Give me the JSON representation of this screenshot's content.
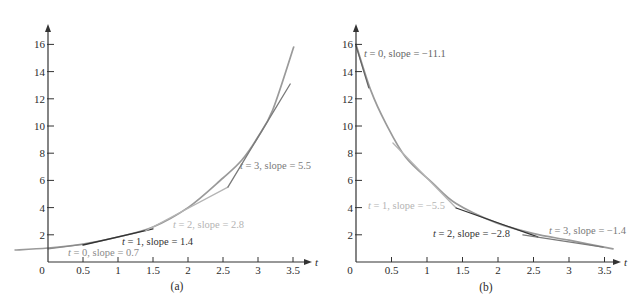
{
  "chart_data": [
    {
      "type": "line",
      "title": "(a)",
      "caption": "(a)",
      "xlabel": "t",
      "ylabel": "",
      "xlim": [
        0,
        3.5
      ],
      "ylim": [
        0,
        16
      ],
      "grid": false,
      "legend": null,
      "origin_label": "0",
      "x_ticks": [
        0.5,
        1,
        1.5,
        2,
        2.5,
        3,
        3.5
      ],
      "x_tick_labels": [
        "0.5",
        "1",
        "1.5",
        "2",
        "2.5",
        "3",
        "3.5"
      ],
      "y_ticks": [
        2,
        4,
        6,
        8,
        10,
        12,
        14,
        16
      ],
      "y_tick_labels": [
        "2",
        "4",
        "6",
        "8",
        "10",
        "12",
        "14",
        "16"
      ],
      "series": [
        {
          "name": "increasing curve",
          "color": "#9a9a9a",
          "points": [
            [
              -0.47,
              0.88
            ],
            [
              0,
              1.03
            ],
            [
              0.5,
              1.32
            ],
            [
              1.0,
              1.84
            ],
            [
              1.5,
              2.57
            ],
            [
              2.01,
              4.04
            ],
            [
              2.5,
              6.18
            ],
            [
              2.77,
              7.5
            ],
            [
              2.99,
              9.12
            ],
            [
              3.21,
              11.18
            ],
            [
              3.51,
              15.81
            ]
          ]
        }
      ],
      "tangents": [
        {
          "t": 0,
          "slope": 0.7,
          "label": "t = 0, slope = 0.7",
          "color": "#8a8a8a",
          "from": [
            0,
            0.96
          ],
          "to": [
            0.5,
            1.29
          ],
          "label_pos": [
            68,
            256
          ]
        },
        {
          "t": 1,
          "slope": 1.4,
          "label": "t = 1, slope = 1.4",
          "color": "#333333",
          "from": [
            0.5,
            1.25
          ],
          "to": [
            1.5,
            2.43
          ],
          "label_pos": [
            122,
            245
          ]
        },
        {
          "t": 2,
          "slope": 2.8,
          "label": "t = 2, slope = 2.8",
          "color": "#b4b4b4",
          "from": [
            1.39,
            2.28
          ],
          "to": [
            2.57,
            5.51
          ],
          "label_pos": [
            173,
            228
          ]
        },
        {
          "t": 3,
          "slope": 5.5,
          "label": "t = 3, slope = 5.5",
          "color": "#7a7a7a",
          "from": [
            2.57,
            5.51
          ],
          "to": [
            3.46,
            13.09
          ],
          "label_pos": [
            240,
            169
          ]
        }
      ]
    },
    {
      "type": "line",
      "title": "(b)",
      "caption": "(b)",
      "xlabel": "t",
      "ylabel": "",
      "xlim": [
        0,
        3.5
      ],
      "ylim": [
        0,
        16
      ],
      "grid": false,
      "legend": null,
      "origin_label": "0",
      "x_ticks": [
        0.5,
        1,
        1.5,
        2,
        2.5,
        3,
        3.5
      ],
      "x_tick_labels": [
        "0.5",
        "1",
        "1.5",
        "2",
        "2.5",
        "3",
        "3.5"
      ],
      "y_ticks": [
        2,
        4,
        6,
        8,
        10,
        12,
        14,
        16
      ],
      "y_tick_labels": [
        "2",
        "4",
        "6",
        "8",
        "10",
        "12",
        "14",
        "16"
      ],
      "series": [
        {
          "name": "decreasing curve",
          "color": "#9a9a9a",
          "points": [
            [
              0,
              16.0
            ],
            [
              0.21,
              12.6
            ],
            [
              0.42,
              10.2
            ],
            [
              0.7,
              7.7
            ],
            [
              1.08,
              5.8
            ],
            [
              1.41,
              4.3
            ],
            [
              1.97,
              2.9
            ],
            [
              2.49,
              2.1
            ],
            [
              3.0,
              1.6
            ],
            [
              3.62,
              0.96
            ]
          ]
        }
      ],
      "tangents": [
        {
          "t": 0,
          "slope": -11.1,
          "label": "t = 0, slope = −11.1",
          "color": "#666666",
          "from": [
            0,
            15.9
          ],
          "to": [
            0.18,
            12.8
          ],
          "label_pos": [
            364,
            57
          ]
        },
        {
          "t": 1,
          "slope": -5.5,
          "label": "t = 1, slope = −5.5",
          "color": "#b4b4b4",
          "from": [
            0.52,
            8.75
          ],
          "to": [
            1.41,
            3.97
          ],
          "label_pos": [
            368,
            209
          ]
        },
        {
          "t": 2,
          "slope": -2.8,
          "label": "t = 2, slope = −2.8",
          "color": "#333333",
          "from": [
            1.41,
            3.97
          ],
          "to": [
            2.56,
            1.84
          ],
          "label_pos": [
            433,
            237
          ]
        },
        {
          "t": 3,
          "slope": -1.4,
          "label": "t = 3, slope = −1.4",
          "color": "#7a7a7a",
          "from": [
            2.35,
            1.99
          ],
          "to": [
            3.48,
            1.1
          ],
          "label_pos": [
            549,
            234
          ]
        }
      ]
    }
  ]
}
